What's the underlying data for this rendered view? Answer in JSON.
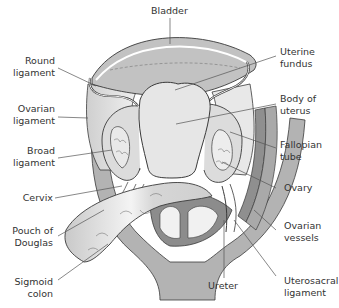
{
  "diagram": {
    "colors": {
      "background": "#ffffff",
      "line": "#3a3a3a",
      "light_fill": "#e4e4e4",
      "mid_fill": "#c8c8c8",
      "dark_fill": "#9a9a9a",
      "label_text": "#333333",
      "leader_line": "#555555"
    },
    "labels": {
      "bladder": [
        "Bladder"
      ],
      "round_ligament": [
        "Round",
        "ligament"
      ],
      "ovarian_ligament": [
        "Ovarian",
        "ligament"
      ],
      "broad_ligament": [
        "Broad",
        "ligament"
      ],
      "cervix": [
        "Cervix"
      ],
      "pouch_of_douglas": [
        "Pouch of",
        "Douglas"
      ],
      "sigmoid_colon": [
        "Sigmoid",
        "colon"
      ],
      "uterine_fundus": [
        "Uterine",
        "fundus"
      ],
      "body_of_uterus": [
        "Body of",
        "uterus"
      ],
      "fallopian_tube": [
        "Fallopian",
        "tube"
      ],
      "ovary": [
        "Ovary"
      ],
      "ovarian_vessels": [
        "Ovarian",
        "vessels"
      ],
      "ureter": [
        "Ureter"
      ],
      "uterosacral_ligament": [
        "Uterosacral",
        "ligament"
      ]
    }
  }
}
